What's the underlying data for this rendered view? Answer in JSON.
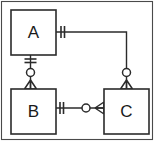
{
  "diagram": {
    "notation": "crow's-foot",
    "frame": {
      "visible": true,
      "color": "#4a4a4a"
    },
    "line_color": "#2b2b2b",
    "background": "#ffffff",
    "entities": [
      {
        "id": "A",
        "label": "A",
        "x": 11,
        "y": 10,
        "width": 45,
        "height": 45
      },
      {
        "id": "B",
        "label": "B",
        "x": 11,
        "y": 89,
        "width": 45,
        "height": 45
      },
      {
        "id": "C",
        "label": "C",
        "x": 104,
        "y": 89,
        "width": 45,
        "height": 45
      }
    ],
    "relationships": [
      {
        "id": "a-c",
        "from": "A",
        "to": "C",
        "from_cardinality": "one-and-only-one",
        "to_cardinality": "zero-or-many",
        "from_side": "right",
        "to_side": "top",
        "routing": "orthogonal"
      },
      {
        "id": "a-b",
        "from": "A",
        "to": "B",
        "from_cardinality": "one-and-only-one",
        "to_cardinality": "zero-or-many",
        "from_side": "bottom",
        "to_side": "top",
        "routing": "straight"
      },
      {
        "id": "b-c",
        "from": "B",
        "to": "C",
        "from_cardinality": "one-and-only-one",
        "to_cardinality": "zero-or-many",
        "from_side": "right",
        "to_side": "left",
        "routing": "straight"
      }
    ],
    "legend": {
      "one_and_only_one": "||",
      "zero_or_many": "o<"
    }
  }
}
